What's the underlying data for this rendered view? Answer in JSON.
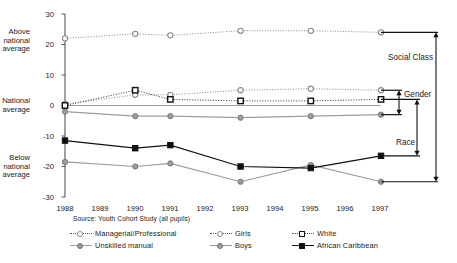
{
  "chart_data": {
    "type": "line",
    "title": "",
    "xlabel": "",
    "ylabel": "",
    "ylim": [
      -30,
      30
    ],
    "grid": false,
    "legend_position": "bottom",
    "x": [
      1988,
      1989,
      1990,
      1991,
      1992,
      1993,
      1994,
      1995,
      1996,
      1997
    ],
    "categories": [
      "1988",
      "1989",
      "1990",
      "1991",
      "1992",
      "1993",
      "1994",
      "1995",
      "1996",
      "1997"
    ],
    "marker_years": [
      1988,
      1990,
      1991,
      1993,
      1995,
      1997
    ],
    "yticks": [
      30,
      20,
      10,
      0,
      -10,
      -20,
      -30
    ],
    "ytick_labels": [
      "30",
      "20",
      "10",
      "0",
      "-10",
      "-20",
      "-30"
    ],
    "series": [
      {
        "name": "Managerial/Professional",
        "marker": "open-circle",
        "line": "dotted",
        "color": "#8a8a8a",
        "x": [
          1988,
          1990,
          1991,
          1993,
          1995,
          1997
        ],
        "values": [
          22,
          23.5,
          23,
          24.5,
          24.5,
          24
        ]
      },
      {
        "name": "Unskilled manual",
        "marker": "gray-circle",
        "line": "solid",
        "color": "#9d9d9d",
        "x": [
          1988,
          1990,
          1991,
          1993,
          1995,
          1997
        ],
        "values": [
          -18.5,
          -20,
          -19,
          -25,
          -19.5,
          -25
        ]
      },
      {
        "name": "Girls",
        "marker": "open-circle",
        "line": "dotted",
        "color": "#8a8a8a",
        "x": [
          1988,
          1990,
          1991,
          1993,
          1995,
          1997
        ],
        "values": [
          0.5,
          3.5,
          3.5,
          5,
          5.5,
          5
        ]
      },
      {
        "name": "Boys",
        "marker": "gray-circle",
        "line": "solid",
        "color": "#9d9d9d",
        "x": [
          1988,
          1990,
          1991,
          1993,
          1995,
          1997
        ],
        "values": [
          -2,
          -3.5,
          -3.5,
          -4,
          -3.5,
          -3
        ]
      },
      {
        "name": "White",
        "marker": "open-square",
        "line": "dotted",
        "color": "#111111",
        "x": [
          1988,
          1990,
          1991,
          1993,
          1995,
          1997
        ],
        "values": [
          0,
          5,
          2,
          1.5,
          1.5,
          2
        ]
      },
      {
        "name": "African Caribbean",
        "marker": "black-square",
        "line": "solid",
        "color": "#111111",
        "x": [
          1988,
          1990,
          1991,
          1993,
          1995,
          1997
        ],
        "values": [
          -11.5,
          -14,
          -13,
          -20,
          -20.5,
          -16.5
        ]
      }
    ],
    "annotations": [
      {
        "label": "Social Class",
        "from_series": "Managerial/Professional",
        "to_series": "Unskilled manual",
        "from_value": 24,
        "to_value": -25
      },
      {
        "label": "Gender",
        "from_series": "Girls",
        "to_series": "Boys",
        "from_value": 5,
        "to_value": -3
      },
      {
        "label": "Race",
        "from_series": "White",
        "to_series": "African Caribbean",
        "from_value": 2,
        "to_value": -16.5
      }
    ]
  },
  "axis": {
    "y_labels": [
      "30",
      "20",
      "10",
      "0",
      "-10",
      "-20",
      "-30"
    ],
    "x_labels": [
      "1988",
      "1989",
      "1990",
      "1991",
      "1992",
      "1993",
      "1994",
      "1995",
      "1996",
      "1997"
    ],
    "side_labels": {
      "above": "Above\nnational\naverage",
      "above_line1": "Above",
      "above_line2": "national",
      "above_line3": "average",
      "national_line1": "National",
      "national_line2": "average",
      "below_line1": "Below",
      "below_line2": "national",
      "below_line3": "average"
    }
  },
  "source": {
    "text": "Source: Youth Cohort Study (all pupils)"
  },
  "annotations": {
    "social_class": "Social  Class",
    "gender": "Gender",
    "race": "Race"
  },
  "legend": {
    "items": [
      {
        "label": "Managerial/Professional",
        "marker": "open-circle",
        "line": "dotted"
      },
      {
        "label": "Girls",
        "marker": "open-circle",
        "line": "dotted"
      },
      {
        "label": "White",
        "marker": "open-square",
        "line": "dotted"
      },
      {
        "label": "Unskilled manual",
        "marker": "gray-circle",
        "line": "solid"
      },
      {
        "label": "Boys",
        "marker": "gray-circle",
        "line": "solid"
      },
      {
        "label": "African Caribbean",
        "marker": "black-square",
        "line": "solid"
      }
    ]
  },
  "colors": {
    "gray_series": "#9d9d9d",
    "black_series": "#111111",
    "axis": "#555555",
    "text": "#1a1a1a"
  }
}
